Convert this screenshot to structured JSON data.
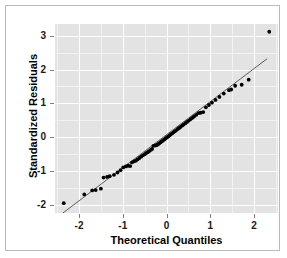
{
  "chart_data": {
    "type": "scatter",
    "title": "",
    "xlabel": "Theoretical Quantiles",
    "ylabel": "Standardized Residuals",
    "xlim": [
      -2.55,
      2.55
    ],
    "ylim": [
      -2.25,
      3.35
    ],
    "xticks": [
      -2,
      -1,
      0,
      1,
      2
    ],
    "xticklabels": [
      "-2",
      "-1",
      "0",
      "1",
      "2"
    ],
    "yticks": [
      -2,
      -1,
      0,
      1,
      2,
      3
    ],
    "yticklabels": [
      "-2",
      "-1",
      "0",
      "1",
      "2",
      "3"
    ],
    "grid": true,
    "legend": "none",
    "panel_background": "#e3e3e3",
    "gridline_color": "#ffffff",
    "point_color": "#000000",
    "line_color": "#4d4d4d",
    "reference_line": {
      "label": "qq reference line",
      "x": [
        -2.38,
        2.3
      ],
      "y": [
        -2.26,
        2.32
      ]
    },
    "series": [
      {
        "name": "standardized residuals",
        "x": [
          -2.35,
          -1.88,
          -1.7,
          -1.62,
          -1.5,
          -1.44,
          -1.36,
          -1.3,
          -1.2,
          -1.12,
          -1.05,
          -0.99,
          -0.93,
          -0.88,
          -0.83,
          -0.79,
          -0.74,
          -0.7,
          -0.66,
          -0.62,
          -0.58,
          -0.54,
          -0.5,
          -0.47,
          -0.43,
          -0.4,
          -0.36,
          -0.33,
          -0.3,
          -0.26,
          -0.23,
          -0.2,
          -0.17,
          -0.14,
          -0.11,
          -0.08,
          -0.05,
          -0.02,
          0.01,
          0.04,
          0.07,
          0.1,
          0.13,
          0.16,
          0.19,
          0.22,
          0.26,
          0.29,
          0.32,
          0.36,
          0.39,
          0.43,
          0.47,
          0.51,
          0.55,
          0.59,
          0.63,
          0.68,
          0.73,
          0.78,
          0.84,
          0.9,
          0.97,
          1.04,
          1.12,
          1.21,
          1.31,
          1.43,
          1.48,
          1.57,
          1.72,
          1.88,
          2.35
        ],
        "y": [
          -1.96,
          -1.7,
          -1.58,
          -1.57,
          -1.53,
          -1.2,
          -1.18,
          -1.16,
          -1.12,
          -1.05,
          -0.98,
          -0.9,
          -0.87,
          -0.85,
          -0.86,
          -0.75,
          -0.72,
          -0.7,
          -0.66,
          -0.62,
          -0.58,
          -0.54,
          -0.51,
          -0.48,
          -0.45,
          -0.42,
          -0.38,
          -0.35,
          -0.26,
          -0.25,
          -0.24,
          -0.22,
          -0.19,
          -0.16,
          -0.13,
          -0.1,
          -0.07,
          -0.04,
          -0.01,
          0.02,
          0.05,
          0.08,
          0.11,
          0.14,
          0.17,
          0.2,
          0.24,
          0.27,
          0.3,
          0.34,
          0.37,
          0.41,
          0.45,
          0.49,
          0.53,
          0.57,
          0.61,
          0.66,
          0.71,
          0.72,
          0.74,
          0.88,
          0.95,
          1.02,
          1.1,
          1.19,
          1.29,
          1.39,
          1.41,
          1.52,
          1.55,
          1.7,
          3.12
        ]
      }
    ]
  }
}
